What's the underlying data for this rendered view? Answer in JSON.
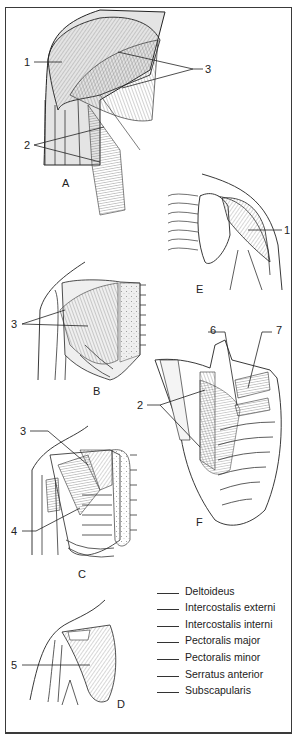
{
  "figure": {
    "panels": [
      {
        "id": "A",
        "label": "A",
        "callouts": [
          "1",
          "2",
          "3"
        ]
      },
      {
        "id": "B",
        "label": "B",
        "callouts": [
          "3"
        ]
      },
      {
        "id": "C",
        "label": "C",
        "callouts": [
          "3",
          "4"
        ]
      },
      {
        "id": "D",
        "label": "D",
        "callouts": [
          "5"
        ]
      },
      {
        "id": "E",
        "label": "E",
        "callouts": [
          "1"
        ]
      },
      {
        "id": "F",
        "label": "F",
        "callouts": [
          "2",
          "6",
          "7"
        ]
      }
    ],
    "callouts": {
      "a1": "1",
      "a2": "2",
      "a3": "3",
      "b3": "3",
      "c3": "3",
      "c4": "4",
      "d5": "5",
      "e1": "1",
      "f2": "2",
      "f6": "6",
      "f7": "7"
    },
    "legend": {
      "items": [
        {
          "blank": "",
          "label": "Deltoideus"
        },
        {
          "blank": "",
          "label": "Intercostalis externi"
        },
        {
          "blank": "",
          "label": "Intercostalis interni"
        },
        {
          "blank": "",
          "label": "Pectoralis major"
        },
        {
          "blank": "",
          "label": "Pectoralis minor"
        },
        {
          "blank": "",
          "label": "Serratus anterior"
        },
        {
          "blank": "",
          "label": "Subscapularis"
        }
      ]
    },
    "colors": {
      "ink": "#1a1a1a",
      "muscle_shade": "#d8d8d8",
      "frame": "#3a3a3a",
      "background": "#ffffff"
    }
  }
}
